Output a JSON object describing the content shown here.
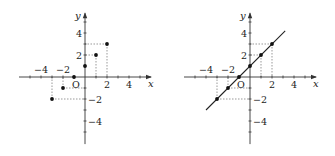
{
  "figure": {
    "panels": [
      {
        "id": "left",
        "title": "",
        "origin_px": [
          85,
          77
        ],
        "unit_px": 11,
        "x_axis": {
          "from": -6,
          "to": 6,
          "label": "x"
        },
        "y_axis": {
          "from": -6.1,
          "to": 5.8,
          "label": "y"
        },
        "origin_label": "O",
        "x_tick_labels": [
          {
            "v": -4,
            "t": "−4"
          },
          {
            "v": -2,
            "t": "−2"
          },
          {
            "v": 2,
            "t": "2"
          },
          {
            "v": 4,
            "t": "4"
          }
        ],
        "y_tick_labels": [
          {
            "v": 4,
            "t": "4"
          },
          {
            "v": 2,
            "t": "2"
          },
          {
            "v": -2,
            "t": "−2"
          },
          {
            "v": -4,
            "t": "−4"
          }
        ],
        "points": [
          [
            -3,
            -2
          ],
          [
            -2,
            -1
          ],
          [
            -1,
            0
          ],
          [
            0,
            1
          ],
          [
            1,
            2
          ],
          [
            2,
            3
          ]
        ],
        "show_line": false
      },
      {
        "id": "right",
        "title": "",
        "origin_px": [
          250,
          77
        ],
        "unit_px": 11,
        "x_axis": {
          "from": -6,
          "to": 6,
          "label": "x"
        },
        "y_axis": {
          "from": -6.1,
          "to": 5.8,
          "label": "y"
        },
        "origin_label": "O",
        "x_tick_labels": [
          {
            "v": -4,
            "t": "−4"
          },
          {
            "v": -2,
            "t": "−2"
          },
          {
            "v": 2,
            "t": "2"
          },
          {
            "v": 4,
            "t": "4"
          }
        ],
        "y_tick_labels": [
          {
            "v": 4,
            "t": "4"
          },
          {
            "v": 2,
            "t": "2"
          },
          {
            "v": -2,
            "t": "−2"
          },
          {
            "v": -4,
            "t": "−4"
          }
        ],
        "points": [
          [
            -3,
            -2
          ],
          [
            -2,
            -1
          ],
          [
            -1,
            0
          ],
          [
            0,
            1
          ],
          [
            1,
            2
          ],
          [
            2,
            3
          ]
        ],
        "show_line": true,
        "line": {
          "equation": "y = x + 1",
          "x_from": -4,
          "x_to": 3.2
        }
      }
    ]
  }
}
